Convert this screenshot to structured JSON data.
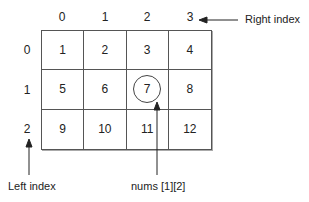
{
  "diagram": {
    "title": "",
    "column_indices": [
      "0",
      "1",
      "2",
      "3"
    ],
    "row_indices": [
      "0",
      "1",
      "2"
    ],
    "cells": [
      [
        "1",
        "2",
        "3",
        "4"
      ],
      [
        "5",
        "6",
        "7",
        "8"
      ],
      [
        "9",
        "10",
        "11",
        "12"
      ]
    ],
    "highlighted_cell": {
      "row": 1,
      "col": 2
    },
    "annotations": {
      "right_index": "Right index",
      "left_index": "Left index",
      "element_ref": "nums [1][2]"
    }
  }
}
